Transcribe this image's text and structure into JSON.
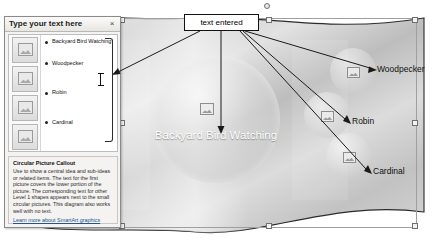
{
  "app": {
    "title": "SmartArt Circular Picture Callout editing"
  },
  "text_pane": {
    "title": "Type your text here",
    "close_label": "×",
    "bullets": [
      "Backyard Bird Watching",
      "Woodpecker",
      "Robin",
      "Cardinal"
    ],
    "thumbnail_count": 4,
    "description": {
      "heading": "Circular Picture Callout",
      "body": "Use to show a central idea and sub-ideas or related items. The text for the first picture covers the lower portion of the picture. The corresponding text for other Level 1 shapes appears next to the small circular pictures. This diagram also works well with no text.",
      "link": "Learn more about SmartArt graphics"
    }
  },
  "diagram": {
    "center_label": "Backyard Bird Watching",
    "side_labels": [
      "Woodpecker",
      "Robin",
      "Cardinal"
    ]
  },
  "annotation": {
    "callout_label": "text entered"
  },
  "colors": {
    "pane_bg": "#f4f3f1",
    "pane_border": "#8a8a8a",
    "link": "#23528c",
    "callout_border": "#111111",
    "center_text": "#ffffff"
  }
}
